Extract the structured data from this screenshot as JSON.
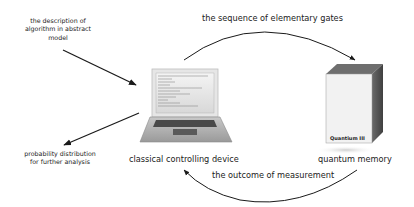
{
  "labels": {
    "input_description": [
      "the description of",
      "algorithm in abstract",
      "model"
    ],
    "output_distribution": [
      "probability distribution",
      "for further analysis"
    ],
    "gates_arc": "the sequence of elementary gates",
    "measurement_arc": "the outcome of measurement",
    "classical_device": "classical controlling device",
    "quantum_memory": "quantum memory"
  },
  "quantum_box": {
    "brand": "Quantium III"
  },
  "colors": {
    "arrow": "#1a1a1a",
    "box_top": "#6e6e6e",
    "box_side": "#555555",
    "box_front": "#f2f2f2",
    "laptop_body": "#b8b8b8"
  }
}
